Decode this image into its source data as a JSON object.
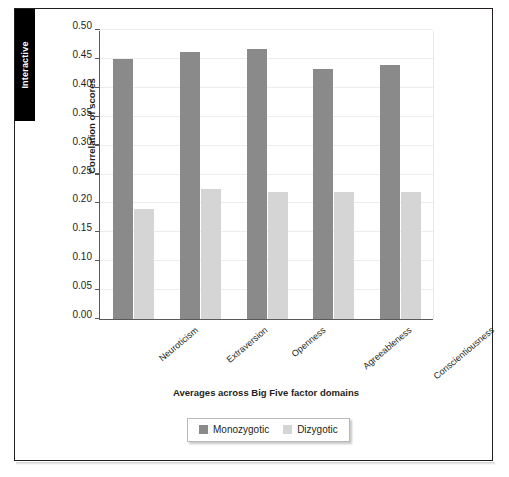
{
  "sidebar": {
    "tab_label": "Interactive"
  },
  "chart_data": {
    "type": "bar",
    "title": "",
    "xlabel": "Averages across Big Five factor domains",
    "ylabel": "Correlation of scores",
    "categories": [
      "Neuroticism",
      "Extraversion",
      "Openness",
      "Agreeableness",
      "Conscientiousness"
    ],
    "series": [
      {
        "name": "Monozygotic",
        "color": "#8a8a8a",
        "values": [
          0.45,
          0.462,
          0.468,
          0.433,
          0.439
        ]
      },
      {
        "name": "Dizygotic",
        "color": "#d5d5d5",
        "values": [
          0.19,
          0.225,
          0.22,
          0.22,
          0.22
        ]
      }
    ],
    "ylim": [
      0.0,
      0.5
    ],
    "ytick_step": 0.05,
    "ytick_labels": [
      "0.50",
      "0.45",
      "0.40",
      "0.35",
      "0.30",
      "0.25",
      "0.20",
      "0.15",
      "0.10",
      "0.05",
      "0.00"
    ],
    "ytick_values": [
      0.5,
      0.45,
      0.4,
      0.35,
      0.3,
      0.25,
      0.2,
      0.15,
      0.1,
      0.05,
      0.0
    ],
    "grid": true,
    "legend_position": "bottom-center"
  }
}
